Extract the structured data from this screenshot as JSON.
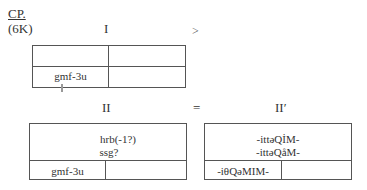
{
  "header": {
    "label_cp": "CP.",
    "label_6k": "(6K)"
  },
  "row1": {
    "title_left": "I",
    "operator": ">",
    "table_i": {
      "top_row": [
        "",
        ""
      ],
      "bottom_row": [
        "gmf-3u",
        ""
      ]
    }
  },
  "row2": {
    "title_left": "II",
    "operator": "=",
    "title_right": "II′",
    "table_ii": {
      "top_lines": [
        "hrb(-1?)",
        "ssg?"
      ],
      "bottom_row": [
        "gmf-3u",
        ""
      ]
    },
    "table_ii_prime": {
      "top_lines": [
        "-ittǝQİM-",
        "-ittǝQåM-"
      ],
      "bottom_row": [
        "-iθQǝMIM-",
        ""
      ]
    }
  }
}
